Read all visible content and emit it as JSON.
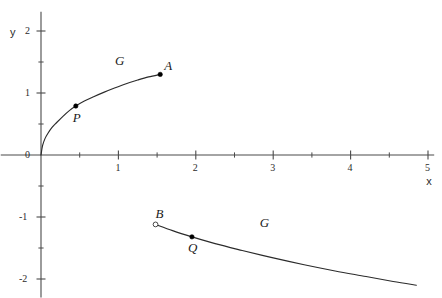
{
  "chart_data": {
    "type": "line",
    "title": "",
    "xlabel": "x",
    "ylabel": "y",
    "xlim": [
      -0.52,
      5.08
    ],
    "ylim": [
      -2.3,
      2.31
    ],
    "grid": false,
    "legend": "none",
    "x_ticks_major": [
      1,
      2,
      3,
      4,
      5
    ],
    "x_tick_labels": [
      "1",
      "2",
      "3",
      "4",
      "5"
    ],
    "x_ticks_minor": [
      0.5,
      1.5,
      2.5,
      3.5,
      4.5
    ],
    "y_ticks_major": [
      2,
      1,
      0,
      -1,
      -2
    ],
    "y_tick_labels": [
      "2",
      "1",
      "0",
      "-1",
      "-2"
    ],
    "y_ticks_minor": [
      1.5,
      0.5,
      -0.5,
      -1.5
    ],
    "origin_label": "0",
    "series": [
      {
        "name": "G-upper",
        "label": "G",
        "description": "square-root branch rising from origin through P to A",
        "x": [
          0.0,
          0.02,
          0.05,
          0.09,
          0.14,
          0.2,
          0.28,
          0.37,
          0.45,
          0.56,
          0.68,
          0.81,
          0.95,
          1.1,
          1.25,
          1.39,
          1.54
        ],
        "y": [
          0.0,
          0.15,
          0.26,
          0.35,
          0.44,
          0.52,
          0.62,
          0.72,
          0.79,
          0.87,
          0.94,
          1.01,
          1.08,
          1.15,
          1.21,
          1.26,
          1.3
        ]
      },
      {
        "name": "G-lower",
        "label": "G",
        "description": "gently descending branch from open endpoint B through Q toward lower right",
        "x": [
          1.48,
          1.7,
          1.95,
          2.25,
          2.6,
          3.0,
          3.4,
          3.8,
          4.2,
          4.55,
          4.85
        ],
        "y": [
          -1.12,
          -1.22,
          -1.32,
          -1.43,
          -1.54,
          -1.66,
          -1.77,
          -1.87,
          -1.96,
          -2.04,
          -2.1
        ]
      }
    ],
    "points": [
      {
        "name": "A",
        "label": "A",
        "x": 1.54,
        "y": 1.3,
        "marker": "filled",
        "label_dx": 4,
        "label_dy": -15
      },
      {
        "name": "P",
        "label": "P",
        "x": 0.45,
        "y": 0.79,
        "marker": "filled",
        "label_dx": -3,
        "label_dy": 5
      },
      {
        "name": "B",
        "label": "B",
        "x": 1.48,
        "y": -1.12,
        "marker": "open",
        "label_dx": 0,
        "label_dy": -17
      },
      {
        "name": "Q",
        "label": "Q",
        "x": 1.95,
        "y": -1.32,
        "marker": "filled",
        "label_dx": -4,
        "label_dy": 4
      }
    ],
    "curve_labels": [
      {
        "name": "G-upper-label",
        "text": "G",
        "x": 1.02,
        "y": 1.5
      },
      {
        "name": "G-lower-label",
        "text": "G",
        "x": 2.89,
        "y": -1.12
      }
    ],
    "colors": {
      "curve": "#2b2b2b",
      "axis": "#4a4a4a",
      "text": "#1a1a1a",
      "background": "#ffffff"
    }
  }
}
